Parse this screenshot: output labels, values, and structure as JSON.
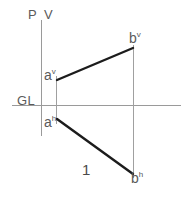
{
  "diagram": {
    "background_color": "#ffffff",
    "reference_lines": {
      "vertical_pv": {
        "label_left": "P",
        "label_right": "V",
        "color": "#9a9a9a",
        "x": 41,
        "y1": 20,
        "y2": 136,
        "width": 1
      },
      "ground_line": {
        "label": "GL",
        "color": "#9a9a9a",
        "x1": 12,
        "x2": 181,
        "y": 105,
        "width": 1
      }
    },
    "projectors": [
      {
        "name": "projector-a",
        "color": "#a0a0a0",
        "x": 56,
        "y1": 76,
        "y2": 124,
        "width": 1
      },
      {
        "name": "projector-b",
        "color": "#a0a0a0",
        "x": 133,
        "y1": 45,
        "y2": 178,
        "width": 1
      }
    ],
    "segments": [
      {
        "name": "vertical-projection-av-bv",
        "from_label": "a",
        "from_sup": "v",
        "to_label": "b",
        "to_sup": "v",
        "color": "#1c1c1c",
        "width": 2.4,
        "x1": 57,
        "y1": 80,
        "x2": 133,
        "y2": 48
      },
      {
        "name": "horizontal-projection-ah-bh",
        "from_label": "a",
        "from_sup": "h",
        "to_label": "b",
        "to_sup": "h",
        "color": "#1c1c1c",
        "width": 2.4,
        "x1": 57,
        "y1": 119,
        "x2": 133,
        "y2": 174
      }
    ],
    "labels": {
      "p": "P",
      "v": "V",
      "gl": "GL",
      "a_vertical": "a",
      "a_vertical_sup": "v",
      "a_horizontal": "a",
      "a_horizontal_sup": "h",
      "b_vertical": "b",
      "b_vertical_sup": "v",
      "b_horizontal": "b",
      "b_horizontal_sup": "h",
      "figure_number": "1"
    },
    "colors": {
      "ink": "#1c1c1c",
      "thin_line": "#9a9a9a",
      "text": "#5a5a5a"
    }
  }
}
